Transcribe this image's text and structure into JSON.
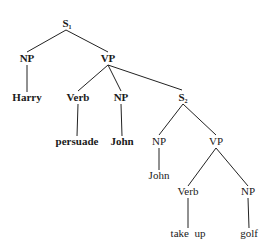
{
  "tree": {
    "nodes": {
      "s1": {
        "label": "S",
        "subscript": "1"
      },
      "np1": {
        "label": "NP"
      },
      "vp1": {
        "label": "VP"
      },
      "harry": {
        "label": "Harry"
      },
      "verb1": {
        "label": "Verb"
      },
      "np2": {
        "label": "NP"
      },
      "persuade": {
        "label": "persuade"
      },
      "john1": {
        "label": "John"
      },
      "s2": {
        "label": "S",
        "subscript": "2"
      },
      "np3": {
        "label": "NP"
      },
      "vp2": {
        "label": "VP"
      },
      "john2": {
        "label": "John"
      },
      "verb2": {
        "label": "Verb"
      },
      "np4": {
        "label": "NP"
      },
      "takeup": {
        "label": "take  up"
      },
      "golf": {
        "label": "golf"
      }
    },
    "edges": [
      [
        "s1",
        "np1"
      ],
      [
        "s1",
        "vp1"
      ],
      [
        "np1",
        "harry"
      ],
      [
        "vp1",
        "verb1"
      ],
      [
        "vp1",
        "np2"
      ],
      [
        "vp1",
        "s2"
      ],
      [
        "verb1",
        "persuade"
      ],
      [
        "np2",
        "john1"
      ],
      [
        "s2",
        "np3"
      ],
      [
        "s2",
        "vp2"
      ],
      [
        "np3",
        "john2"
      ],
      [
        "vp2",
        "verb2"
      ],
      [
        "vp2",
        "np4"
      ],
      [
        "verb2",
        "takeup"
      ],
      [
        "np4",
        "golf"
      ]
    ]
  }
}
